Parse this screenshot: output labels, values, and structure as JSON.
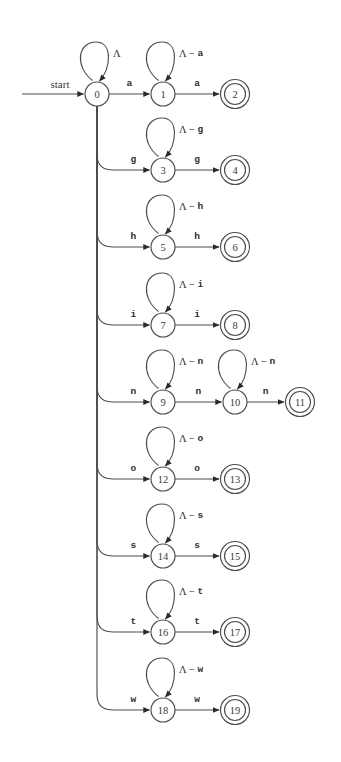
{
  "diagram": {
    "type": "state-transition-diagram",
    "background_color": "#ffffff",
    "stroke_color": "#4d4d4d",
    "start_label": "start",
    "alphabet_symbol": "Λ",
    "geometry": {
      "width": 341,
      "height": 762,
      "node_radius": 12,
      "accept_outer_radius": 14.5,
      "trunk_x": 97,
      "start_arrow_x": 22,
      "col_x": [
        97,
        163,
        235,
        300
      ],
      "row_y": [
        94,
        170,
        247,
        325,
        402,
        479,
        556,
        632,
        710
      ]
    },
    "states": [
      {
        "id": "0",
        "label": "0",
        "x": 97,
        "y": 94,
        "accepting": false
      },
      {
        "id": "1",
        "label": "1",
        "x": 163,
        "y": 94,
        "accepting": false
      },
      {
        "id": "2",
        "label": "2",
        "x": 235,
        "y": 94,
        "accepting": true
      },
      {
        "id": "3",
        "label": "3",
        "x": 163,
        "y": 170,
        "accepting": false
      },
      {
        "id": "4",
        "label": "4",
        "x": 235,
        "y": 170,
        "accepting": true
      },
      {
        "id": "5",
        "label": "5",
        "x": 163,
        "y": 247,
        "accepting": false
      },
      {
        "id": "6",
        "label": "6",
        "x": 235,
        "y": 247,
        "accepting": true
      },
      {
        "id": "7",
        "label": "7",
        "x": 163,
        "y": 325,
        "accepting": false
      },
      {
        "id": "8",
        "label": "8",
        "x": 235,
        "y": 325,
        "accepting": true
      },
      {
        "id": "9",
        "label": "9",
        "x": 163,
        "y": 402,
        "accepting": false
      },
      {
        "id": "10",
        "label": "10",
        "x": 235,
        "y": 402,
        "accepting": false
      },
      {
        "id": "11",
        "label": "11",
        "x": 300,
        "y": 402,
        "accepting": true
      },
      {
        "id": "12",
        "label": "12",
        "x": 163,
        "y": 479,
        "accepting": false
      },
      {
        "id": "13",
        "label": "13",
        "x": 235,
        "y": 479,
        "accepting": true
      },
      {
        "id": "14",
        "label": "14",
        "x": 163,
        "y": 556,
        "accepting": false
      },
      {
        "id": "15",
        "label": "15",
        "x": 235,
        "y": 556,
        "accepting": true
      },
      {
        "id": "16",
        "label": "16",
        "x": 163,
        "y": 632,
        "accepting": false
      },
      {
        "id": "17",
        "label": "17",
        "x": 235,
        "y": 632,
        "accepting": true
      },
      {
        "id": "18",
        "label": "18",
        "x": 163,
        "y": 710,
        "accepting": false
      },
      {
        "id": "19",
        "label": "19",
        "x": 235,
        "y": 710,
        "accepting": true
      }
    ],
    "self_loops": [
      {
        "state": "0",
        "label_prefix": "Λ",
        "label_suffix": "",
        "label_full": "Λ"
      },
      {
        "state": "1",
        "label_prefix": "Λ − ",
        "label_suffix": "a",
        "label_full": "Λ − a"
      },
      {
        "state": "3",
        "label_prefix": "Λ − ",
        "label_suffix": "g",
        "label_full": "Λ − g"
      },
      {
        "state": "5",
        "label_prefix": "Λ − ",
        "label_suffix": "h",
        "label_full": "Λ − h"
      },
      {
        "state": "7",
        "label_prefix": "Λ − ",
        "label_suffix": "i",
        "label_full": "Λ − i"
      },
      {
        "state": "9",
        "label_prefix": "Λ − ",
        "label_suffix": "n",
        "label_full": "Λ − n"
      },
      {
        "state": "10",
        "label_prefix": "Λ − ",
        "label_suffix": "n",
        "label_full": "Λ − n"
      },
      {
        "state": "12",
        "label_prefix": "Λ − ",
        "label_suffix": "o",
        "label_full": "Λ − o"
      },
      {
        "state": "14",
        "label_prefix": "Λ − ",
        "label_suffix": "s",
        "label_full": "Λ − s"
      },
      {
        "state": "16",
        "label_prefix": "Λ − ",
        "label_suffix": "t",
        "label_full": "Λ − t"
      },
      {
        "state": "18",
        "label_prefix": "Λ − ",
        "label_suffix": "w",
        "label_full": "Λ − w"
      }
    ],
    "transitions": [
      {
        "from": "0",
        "to": "1",
        "symbol": "a",
        "kind": "straight"
      },
      {
        "from": "1",
        "to": "2",
        "symbol": "a",
        "kind": "straight"
      },
      {
        "from": "0",
        "to": "3",
        "symbol": "g",
        "kind": "branch"
      },
      {
        "from": "3",
        "to": "4",
        "symbol": "g",
        "kind": "straight"
      },
      {
        "from": "0",
        "to": "5",
        "symbol": "h",
        "kind": "branch"
      },
      {
        "from": "5",
        "to": "6",
        "symbol": "h",
        "kind": "straight"
      },
      {
        "from": "0",
        "to": "7",
        "symbol": "i",
        "kind": "branch"
      },
      {
        "from": "7",
        "to": "8",
        "symbol": "i",
        "kind": "straight"
      },
      {
        "from": "0",
        "to": "9",
        "symbol": "n",
        "kind": "branch"
      },
      {
        "from": "9",
        "to": "10",
        "symbol": "n",
        "kind": "straight"
      },
      {
        "from": "10",
        "to": "11",
        "symbol": "n",
        "kind": "straight"
      },
      {
        "from": "0",
        "to": "12",
        "symbol": "o",
        "kind": "branch"
      },
      {
        "from": "12",
        "to": "13",
        "symbol": "o",
        "kind": "straight"
      },
      {
        "from": "0",
        "to": "14",
        "symbol": "s",
        "kind": "branch"
      },
      {
        "from": "14",
        "to": "15",
        "symbol": "s",
        "kind": "straight"
      },
      {
        "from": "0",
        "to": "16",
        "symbol": "t",
        "kind": "branch"
      },
      {
        "from": "16",
        "to": "17",
        "symbol": "t",
        "kind": "straight"
      },
      {
        "from": "0",
        "to": "18",
        "symbol": "w",
        "kind": "branch"
      },
      {
        "from": "18",
        "to": "19",
        "symbol": "w",
        "kind": "straight"
      }
    ]
  }
}
